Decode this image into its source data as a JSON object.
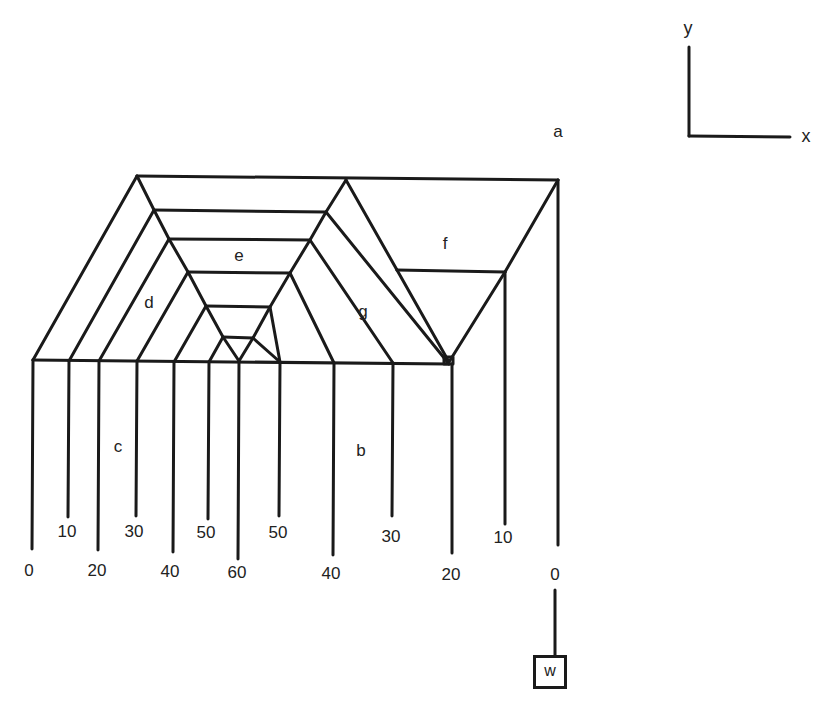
{
  "diagram": {
    "type": "string-art / tension network diagram",
    "region_labels": {
      "a": "a",
      "b": "b",
      "c": "c",
      "d": "d",
      "e": "e",
      "f": "f",
      "g": "g"
    },
    "axes": {
      "x_label": "x",
      "y_label": "y"
    },
    "weight_label": "w",
    "bottom_labels_left": [
      "0",
      "10",
      "20",
      "30",
      "40",
      "50",
      "60"
    ],
    "bottom_labels_right": [
      "50",
      "40",
      "30",
      "20",
      "10",
      "0"
    ],
    "strings": [
      {
        "x": 33,
        "value": "0"
      },
      {
        "x": 69,
        "value": "10"
      },
      {
        "x": 99,
        "value": "20"
      },
      {
        "x": 137,
        "value": "30"
      },
      {
        "x": 174,
        "value": "40"
      },
      {
        "x": 209,
        "value": "50"
      },
      {
        "x": 239,
        "value": "60"
      },
      {
        "x": 280,
        "value": "50"
      },
      {
        "x": 334,
        "value": "40"
      },
      {
        "x": 393,
        "value": "30"
      },
      {
        "x": 449,
        "value": "20"
      },
      {
        "x": 505,
        "value": "10"
      },
      {
        "x": 558,
        "value": "0"
      }
    ]
  }
}
